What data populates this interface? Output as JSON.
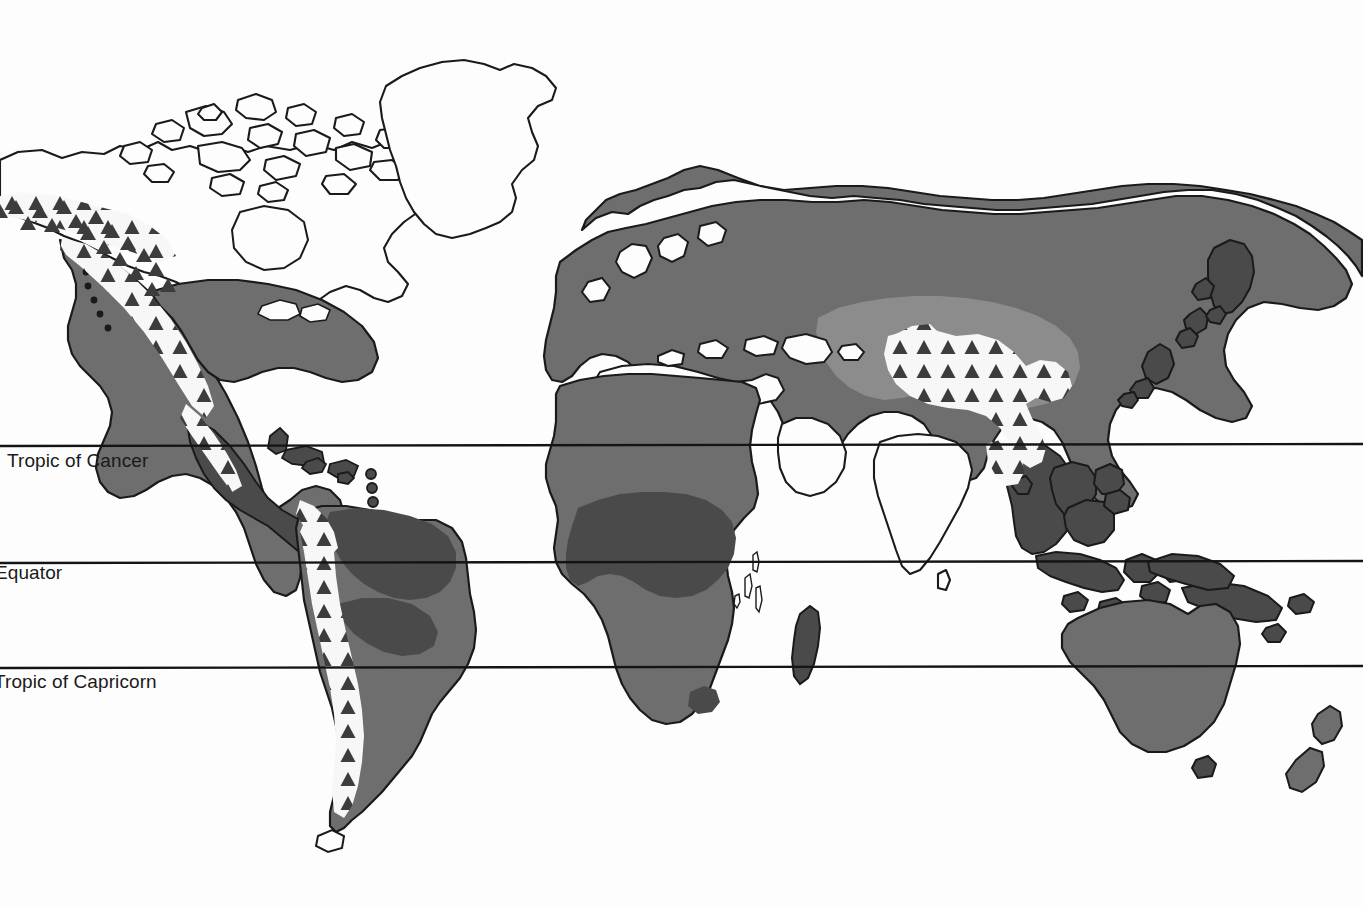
{
  "map": {
    "title": "World distribution map",
    "background_color": "#fdfdfd",
    "outline_color": "#1a1a1a",
    "latitude_lines": [
      {
        "name": "tropic-of-cancer",
        "label": "Tropic of Cancer",
        "y": 446,
        "truncated_left": false
      },
      {
        "name": "equator",
        "label": "Equator",
        "y": 563,
        "truncated_left": true
      },
      {
        "name": "tropic-of-capricorn",
        "label": "Tropic of Capricorn",
        "y": 668,
        "truncated_left": true
      }
    ],
    "legend_colors": {
      "unshaded_land": "#fdfdfd",
      "light_gray_zone": "#8c8c8c",
      "medium_gray_zone": "#6e6e6e",
      "dark_gray_zone": "#4a4a4a",
      "triangle_fill": "#3c3c3c",
      "triangle_band_background": "#f7f7f7",
      "coastline": "#1a1a1a",
      "latitude_line": "#141414"
    },
    "regions": [
      {
        "name": "north-america-range",
        "shading": "medium_gray_zone"
      },
      {
        "name": "greenland-unshaded",
        "shading": "unshaded_land"
      },
      {
        "name": "arctic-canada-unshaded",
        "shading": "unshaded_land"
      },
      {
        "name": "iceland-shaded",
        "shading": "medium_gray_zone"
      },
      {
        "name": "eurasia-range",
        "shading": "medium_gray_zone"
      },
      {
        "name": "central-asia-light-zone",
        "shading": "light_gray_zone"
      },
      {
        "name": "africa-range",
        "shading": "medium_gray_zone"
      },
      {
        "name": "congo-basin-dark-zone",
        "shading": "dark_gray_zone"
      },
      {
        "name": "madagascar-dark",
        "shading": "dark_gray_zone"
      },
      {
        "name": "south-america-range",
        "shading": "medium_gray_zone"
      },
      {
        "name": "amazon-dark-zone",
        "shading": "dark_gray_zone"
      },
      {
        "name": "southeast-asia-dark",
        "shading": "dark_gray_zone"
      },
      {
        "name": "australia-range",
        "shading": "medium_gray_zone"
      },
      {
        "name": "new-guinea-dark",
        "shading": "dark_gray_zone"
      },
      {
        "name": "new-zealand-shaded",
        "shading": "medium_gray_zone"
      },
      {
        "name": "arabia-unshaded",
        "shading": "unshaded_land"
      },
      {
        "name": "india-unshaded",
        "shading": "unshaded_land"
      },
      {
        "name": "sahara-unshaded",
        "shading": "unshaded_land"
      }
    ],
    "triangle_hatch_areas": [
      {
        "name": "alaska-yukon-triangles"
      },
      {
        "name": "rocky-mountains-triangles"
      },
      {
        "name": "sierra-madre-triangles"
      },
      {
        "name": "central-america-triangles"
      },
      {
        "name": "andes-triangles"
      },
      {
        "name": "central-asia-tibet-triangles"
      },
      {
        "name": "himalaya-southeast-triangles"
      }
    ]
  }
}
